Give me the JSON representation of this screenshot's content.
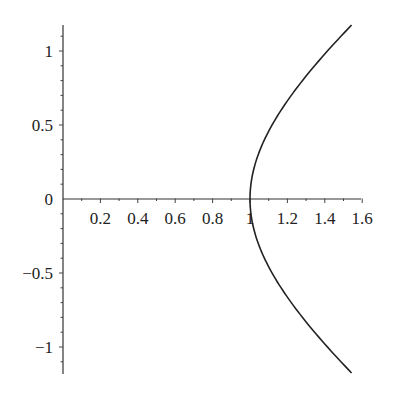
{
  "chart_data": {
    "type": "line",
    "title": "",
    "xlabel": "",
    "ylabel": "",
    "xlim": [
      0,
      1.6
    ],
    "ylim": [
      -1.18,
      1.18
    ],
    "grid": false,
    "legend": null,
    "x_ticks": [
      0.2,
      0.4,
      0.6,
      0.8,
      1,
      1.2,
      1.4,
      1.6
    ],
    "x_tick_labels": [
      "0.2",
      "0.4",
      "0.6",
      "0.8",
      "1",
      "1.2",
      "1.4",
      "1.6"
    ],
    "y_ticks": [
      1,
      0.5,
      0,
      -0.5,
      -1
    ],
    "y_tick_labels": [
      "1",
      "0.5",
      "0",
      "−0.5",
      "−1"
    ],
    "series": [
      {
        "name": "hyperbola x^2 - y^2 = 1 (right branch)",
        "color": "#222222",
        "parametric": "x = cosh(t), y = sinh(t)",
        "t_range": [
          -1.0,
          1.0
        ],
        "points": [
          [
            1.543,
            -1.175
          ],
          [
            1.337,
            -0.888
          ],
          [
            1.185,
            -0.636
          ],
          [
            1.081,
            -0.411
          ],
          [
            1.02,
            -0.201
          ],
          [
            1.0,
            0.0
          ],
          [
            1.02,
            0.201
          ],
          [
            1.081,
            0.411
          ],
          [
            1.185,
            0.636
          ],
          [
            1.337,
            0.888
          ],
          [
            1.543,
            1.175
          ]
        ]
      }
    ]
  },
  "layout": {
    "origin_px": [
      63,
      199
    ],
    "px_per_x": 187,
    "px_per_y": 148,
    "x_axis_end_px": 361,
    "y_axis_top_px": 25,
    "y_axis_bottom_px": 374
  }
}
